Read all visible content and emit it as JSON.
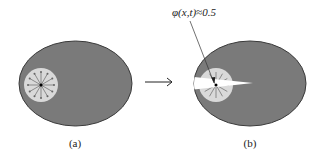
{
  "figure": {
    "panels": [
      {
        "id": "a",
        "caption": "(a)"
      },
      {
        "id": "b",
        "caption": "(b)"
      }
    ],
    "annotation": {
      "text": "φ(x,t)≈0.5"
    },
    "colors": {
      "body": "#7a7a7a",
      "body_outline": "#3a3a3a",
      "inner_region": "#d9d9d9",
      "crack": "#ffffff",
      "line": "#333333"
    }
  }
}
